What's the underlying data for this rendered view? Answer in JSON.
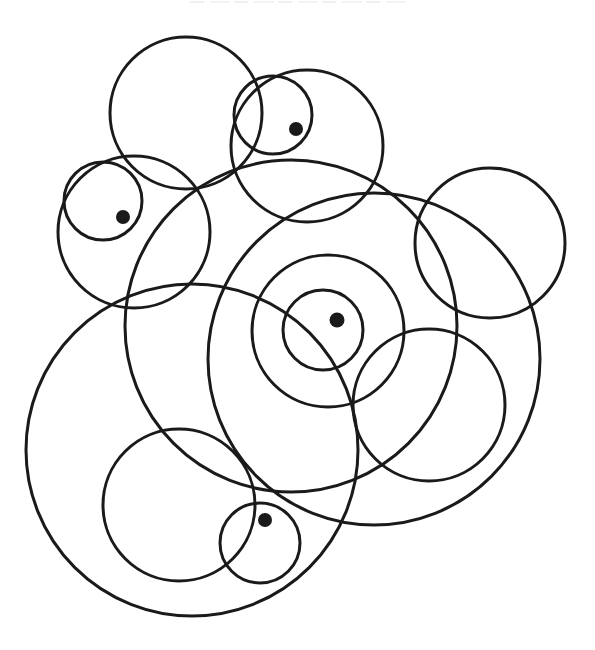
{
  "figure": {
    "stroke_color": "#1a1a1a",
    "stroke_width": 3,
    "dot_color": "#1a1a1a",
    "background": "#ffffff",
    "clipped_caption": {
      "visible": true,
      "legible": false
    },
    "circles": [
      {
        "id": "top-left",
        "cx": 186,
        "cy": 113,
        "r": 76
      },
      {
        "id": "top-small",
        "cx": 273,
        "cy": 115,
        "r": 39
      },
      {
        "id": "top-right-medium",
        "cx": 307,
        "cy": 146,
        "r": 76
      },
      {
        "id": "left-small",
        "cx": 103,
        "cy": 201,
        "r": 39
      },
      {
        "id": "left-medium",
        "cx": 134,
        "cy": 232,
        "r": 76
      },
      {
        "id": "large-center",
        "cx": 291,
        "cy": 326,
        "r": 166
      },
      {
        "id": "large-right",
        "cx": 374,
        "cy": 359,
        "r": 166
      },
      {
        "id": "right-medium",
        "cx": 490,
        "cy": 243,
        "r": 75
      },
      {
        "id": "center-middle",
        "cx": 328,
        "cy": 331,
        "r": 76
      },
      {
        "id": "center-inner",
        "cx": 323,
        "cy": 330,
        "r": 40
      },
      {
        "id": "lower-right-medium",
        "cx": 429,
        "cy": 405,
        "r": 76
      },
      {
        "id": "large-bottom-left",
        "cx": 192,
        "cy": 450,
        "r": 166
      },
      {
        "id": "bottom-left-medium",
        "cx": 179,
        "cy": 505,
        "r": 76
      },
      {
        "id": "bottom-small",
        "cx": 260,
        "cy": 543,
        "r": 40
      }
    ],
    "dots": [
      {
        "id": "dot-top",
        "cx": 296,
        "cy": 129,
        "r": 7
      },
      {
        "id": "dot-left",
        "cx": 123,
        "cy": 217,
        "r": 7
      },
      {
        "id": "dot-center",
        "cx": 337,
        "cy": 320,
        "r": 7.5
      },
      {
        "id": "dot-bottom",
        "cx": 265,
        "cy": 520,
        "r": 7
      }
    ]
  }
}
